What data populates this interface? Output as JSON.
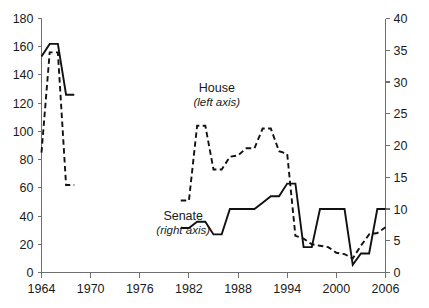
{
  "chart_data": {
    "type": "line",
    "title": "",
    "subtitle": "",
    "xlabel": "",
    "ylabel": "",
    "grid": false,
    "legend_position": "inline-annotations",
    "x": [
      1964,
      1965,
      1966,
      1967,
      1968,
      1981,
      1982,
      1983,
      1984,
      1985,
      1986,
      1987,
      1988,
      1989,
      1990,
      1991,
      1992,
      1993,
      1994,
      1995,
      1996,
      1997,
      1998,
      1999,
      2000,
      2001,
      2002,
      2003,
      2004,
      2005,
      2006
    ],
    "xlim": [
      1964,
      2006
    ],
    "xticks": [
      1964,
      1970,
      1976,
      1982,
      1988,
      1994,
      2000,
      2006
    ],
    "xticklabels": [
      "1964",
      "1970",
      "1976",
      "1982",
      "1988",
      "1994",
      "2000",
      "2006"
    ],
    "left_axis": {
      "label": "House (left axis)",
      "ylim": [
        0,
        180
      ],
      "yticks": [
        0,
        20,
        40,
        60,
        80,
        100,
        120,
        140,
        160,
        180
      ],
      "yticklabels": [
        "0",
        "20",
        "40",
        "60",
        "80",
        "100",
        "120",
        "140",
        "160",
        "180"
      ]
    },
    "right_axis": {
      "label": "Senate (right axis)",
      "ylim": [
        0,
        40
      ],
      "yticks": [
        0,
        5,
        10,
        15,
        20,
        25,
        30,
        35,
        40
      ],
      "yticklabels": [
        "0",
        "5",
        "10",
        "15",
        "20",
        "25",
        "30",
        "35",
        "40"
      ]
    },
    "series": [
      {
        "name": "House",
        "axis": "left",
        "style": "dashed",
        "color": "#111111",
        "points": [
          [
            1964,
            85
          ],
          [
            1965,
            156
          ],
          [
            1966,
            156
          ],
          [
            1967,
            62
          ],
          [
            1968,
            62
          ],
          [
            1981,
            51
          ],
          [
            1982,
            51
          ],
          [
            1983,
            104
          ],
          [
            1984,
            104
          ],
          [
            1985,
            73
          ],
          [
            1986,
            73
          ],
          [
            1987,
            82
          ],
          [
            1988,
            83
          ],
          [
            1989,
            88
          ],
          [
            1990,
            88
          ],
          [
            1991,
            102
          ],
          [
            1992,
            102
          ],
          [
            1993,
            86
          ],
          [
            1994,
            84
          ],
          [
            1995,
            26
          ],
          [
            1996,
            24
          ],
          [
            1997,
            20
          ],
          [
            1998,
            19
          ],
          [
            1999,
            18
          ],
          [
            2000,
            14
          ],
          [
            2001,
            13
          ],
          [
            2002,
            10
          ],
          [
            2003,
            19
          ],
          [
            2004,
            27
          ],
          [
            2005,
            28
          ],
          [
            2006,
            32
          ]
        ]
      },
      {
        "name": "Senate",
        "axis": "right",
        "style": "solid",
        "color": "#111111",
        "points": [
          [
            1964,
            34
          ],
          [
            1965,
            36
          ],
          [
            1966,
            36
          ],
          [
            1967,
            28
          ],
          [
            1968,
            28
          ],
          [
            1981,
            7
          ],
          [
            1982,
            7
          ],
          [
            1983,
            8
          ],
          [
            1984,
            8
          ],
          [
            1985,
            6
          ],
          [
            1986,
            6
          ],
          [
            1987,
            10
          ],
          [
            1988,
            10
          ],
          [
            1989,
            10
          ],
          [
            1990,
            10
          ],
          [
            1991,
            11
          ],
          [
            1992,
            12
          ],
          [
            1993,
            12
          ],
          [
            1994,
            14
          ],
          [
            1995,
            14
          ],
          [
            1996,
            4
          ],
          [
            1997,
            4
          ],
          [
            1998,
            10
          ],
          [
            1999,
            10
          ],
          [
            2000,
            10
          ],
          [
            2001,
            10
          ],
          [
            2002,
            1.2
          ],
          [
            2003,
            3
          ],
          [
            2004,
            3
          ],
          [
            2005,
            10
          ],
          [
            2006,
            10
          ]
        ]
      }
    ],
    "annotations": [
      {
        "name": "house-label",
        "title": "House",
        "subtitle": "(left axis)",
        "x": 1985.4,
        "y_left": 128
      },
      {
        "name": "senate-label",
        "title": "Senate",
        "subtitle": "(right axis)",
        "x": 1981.3,
        "y_left": 37
      }
    ]
  }
}
